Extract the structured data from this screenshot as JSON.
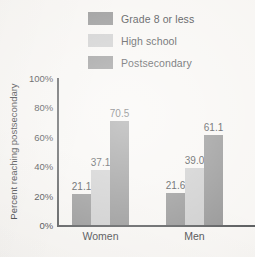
{
  "chart_data": {
    "type": "bar",
    "title": "",
    "xlabel": "",
    "ylabel": "Percent reaching postsecondary",
    "categories": [
      "Women",
      "Men"
    ],
    "series": [
      {
        "name": "Grade 8 or less",
        "values": [
          21.1,
          21.6
        ],
        "color": "#8a8a8a"
      },
      {
        "name": "High school",
        "values": [
          37.1,
          39.0
        ],
        "color": "#c8c8c8"
      },
      {
        "name": "Postsecondary",
        "values": [
          70.5,
          61.1
        ],
        "color": "#8a8a8a"
      }
    ],
    "value_labels": [
      [
        "21.1",
        "37.1",
        "70.5"
      ],
      [
        "21.6",
        "39.0",
        "61.1"
      ]
    ],
    "ylim": [
      0,
      100
    ],
    "yticks": [
      0,
      20,
      40,
      60,
      80,
      100
    ],
    "ytick_labels": [
      "0%",
      "20%",
      "40%",
      "60%",
      "80%",
      "100%"
    ],
    "grid": false,
    "legend_position": "top-center"
  },
  "legend": {
    "items": [
      {
        "label": "Grade 8 or less",
        "color": "#8a8a8a"
      },
      {
        "label": "High school",
        "color": "#c8c8c8"
      },
      {
        "label": "Postsecondary",
        "color": "#8a8a8a"
      }
    ]
  },
  "colors": {
    "axis": "#4a4c4e",
    "text": "#35373a",
    "background": "#f7f5f2",
    "series_dark": "#8a8a8a",
    "series_light": "#c8c8c8"
  }
}
